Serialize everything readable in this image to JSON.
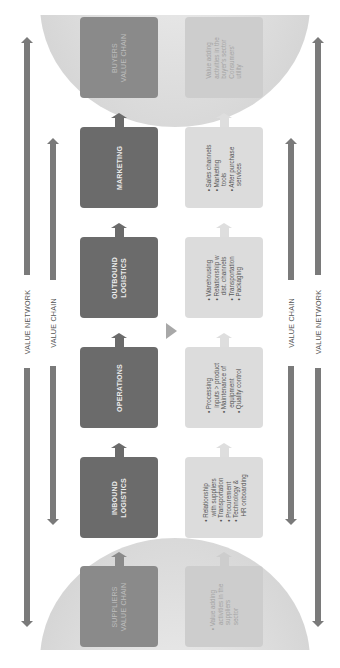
{
  "diagram": {
    "type": "value-chain-network",
    "orientation": "rotated-90-ccw",
    "colors": {
      "primary_box": "#6b6b6b",
      "secondary_box": "#dcdcdc",
      "arrow": "#7a7a7a",
      "dome": "#dedede",
      "background": "#ffffff"
    },
    "axis_labels": {
      "outer_left": "VALUE NETWORK",
      "inner_left": "VALUE CHAIN",
      "inner_right": "VALUE CHAIN",
      "outer_right": "VALUE NETWORK"
    },
    "buyers": {
      "title_line1": "BUYERS",
      "title_line2": "VALUE CHAIN",
      "items": [
        "Value adding",
        "activities in the",
        "buyer's sector",
        "Consumers'",
        "utility"
      ]
    },
    "stages": [
      {
        "title_line1": "MARKETING",
        "title_line2": "",
        "items": [
          "• Sales channels",
          "• Marketing",
          "   tools",
          "• After purchase",
          "   services"
        ]
      },
      {
        "title_line1": "OUTBOUND",
        "title_line2": "LOGISTICS",
        "items": [
          "• Warehousing",
          "• Relationship w",
          "   dist. channels",
          "• Transportation",
          "• Packaging"
        ]
      },
      {
        "title_line1": "OPERATIONS",
        "title_line2": "",
        "items": [
          "• Processing",
          "   inputs > product",
          "• Maintenance of",
          "   equipment",
          "• Quality control"
        ]
      },
      {
        "title_line1": "INBOUND",
        "title_line2": "LOGISTICS",
        "items": [
          "• Relationship",
          "   with suppliers",
          "• Transportation",
          "• Procurement",
          "• Technology &",
          "   HR onboarding"
        ]
      }
    ],
    "suppliers": {
      "title_line1": "SUPPLIERS",
      "title_line2": "VALUE CHAIN",
      "items": [
        "• Value adding",
        "   activities in the",
        "   suppliers",
        "   sector"
      ]
    }
  }
}
